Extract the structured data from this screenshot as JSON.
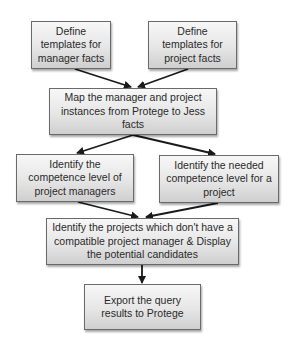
{
  "diagram": {
    "type": "flowchart",
    "colors": {
      "box_border": "#6a6a6a",
      "box_fill_top": "#f7f7f7",
      "box_fill_bottom": "#cfcfcf",
      "text": "#2a2a2a",
      "arrow": "#1a1a1a"
    },
    "nodes": [
      {
        "id": "n1",
        "label": "Define\ntemplates for\nmanager facts"
      },
      {
        "id": "n2",
        "label": "Define\ntemplates for\nproject facts"
      },
      {
        "id": "n3",
        "label": "Map the manager and project\ninstances  from Protege to Jess\nfacts"
      },
      {
        "id": "n4",
        "label": "Identify the\ncompetence level of\nproject managers"
      },
      {
        "id": "n5",
        "label": "Identify the needed\ncompetence level for a\nproject"
      },
      {
        "id": "n6",
        "label": "Identify the projects which don't have a\ncompatible project manager &  Display\nthe potential candidates"
      },
      {
        "id": "n7",
        "label": "Export the query\nresults to Protege"
      }
    ],
    "edges": [
      {
        "from": "n1",
        "to": "n3"
      },
      {
        "from": "n2",
        "to": "n3"
      },
      {
        "from": "n3",
        "to": "n4"
      },
      {
        "from": "n3",
        "to": "n5"
      },
      {
        "from": "n4",
        "to": "n6"
      },
      {
        "from": "n5",
        "to": "n6"
      },
      {
        "from": "n6",
        "to": "n7"
      }
    ]
  }
}
